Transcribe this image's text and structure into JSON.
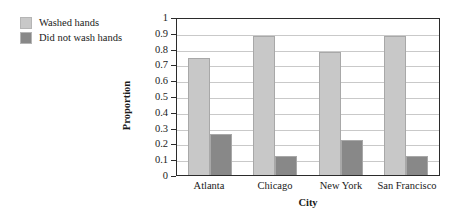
{
  "chart_data": {
    "type": "bar",
    "title": "",
    "xlabel": "City",
    "ylabel": "Proportion",
    "categories": [
      "Atlanta",
      "Chicago",
      "New York",
      "San Francisco"
    ],
    "series": [
      {
        "name": "Washed hands",
        "color": "#c8c8c8",
        "values": [
          0.74,
          0.88,
          0.78,
          0.88
        ]
      },
      {
        "name": "Did not wash hands",
        "color": "#888888",
        "values": [
          0.26,
          0.12,
          0.22,
          0.12
        ]
      }
    ],
    "ylim": [
      0,
      1
    ],
    "yticks": [
      "1",
      "0.9",
      "0.8",
      "0.7",
      "0.6",
      "0.5",
      "0.4",
      "0.3",
      "0.2",
      "0.1",
      "0"
    ],
    "ytick_values": [
      1,
      0.9,
      0.8,
      0.7,
      0.6,
      0.5,
      0.4,
      0.3,
      0.2,
      0.1,
      0
    ],
    "grid": true,
    "legend_position": "upper-left-outside",
    "background": "#ffffff",
    "frame_color": "#2b2b2b",
    "gridline_color": "#c9c9c9"
  },
  "legend": {
    "items": [
      {
        "label": "Washed hands",
        "color": "#c8c8c8"
      },
      {
        "label": "Did not wash hands",
        "color": "#888888"
      }
    ]
  },
  "axes": {
    "y_title": "Proportion",
    "x_title": "City"
  }
}
